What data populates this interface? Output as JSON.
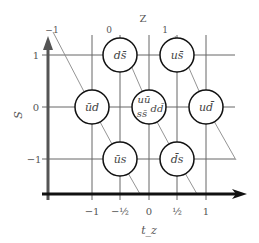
{
  "diagram": {
    "x_axis": {
      "label": "t_z",
      "ticks": [
        "−1",
        "−½",
        "0",
        "½",
        "1"
      ]
    },
    "y_axis": {
      "label": "S",
      "ticks": [
        "1",
        "0",
        "−1"
      ]
    },
    "z_axis": {
      "label": "Z",
      "ticks": [
        "−1",
        "0",
        "1"
      ]
    },
    "nodes": [
      {
        "id": "d-sbar",
        "label": "ds̄",
        "tz": "−½",
        "s": "1"
      },
      {
        "id": "u-sbar",
        "label": "us̄",
        "tz": "½",
        "s": "1"
      },
      {
        "id": "ubar-d",
        "label": "ūd",
        "tz": "−1",
        "s": "0"
      },
      {
        "id": "center",
        "label_top": "uū",
        "label_right": "dd̄",
        "label_bottom": "ss̄",
        "tz": "0",
        "s": "0"
      },
      {
        "id": "u-dbar",
        "label": "ud̄",
        "tz": "1",
        "s": "0"
      },
      {
        "id": "ubar-s",
        "label": "ūs",
        "tz": "−½",
        "s": "−1"
      },
      {
        "id": "dbar-s",
        "label": "d̄s",
        "tz": "½",
        "s": "−1"
      }
    ]
  }
}
